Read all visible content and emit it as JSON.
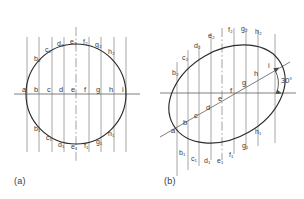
{
  "figure": {
    "colors": {
      "outline": "#2b2b2b",
      "ordinate": "#8a8a8a",
      "axis": "#6f6f6f",
      "centerline": "#8a8a8a",
      "text": "#3a3a3a",
      "background": "#ffffff"
    },
    "panels": [
      {
        "id": "a",
        "caption": "(a)",
        "shape": "circle",
        "description": "True-shape circle with nine equally spaced vertical ordinates",
        "center": {
          "x": 76,
          "y": 94
        },
        "radius": 50,
        "axis_labels": [
          "a",
          "b",
          "c",
          "d",
          "e",
          "f",
          "g",
          "h",
          "i"
        ],
        "upper_labels": [
          "b₂",
          "c₂",
          "d₂",
          "e₂",
          "f₂",
          "g₂",
          "h₂"
        ],
        "lower_labels": [
          "b₁",
          "c₁",
          "d₁",
          "e₁",
          "f₁",
          "g₁",
          "h₁"
        ],
        "ordinate_count": 9,
        "has_vertical_centerline": true,
        "has_horizontal_axis": true
      },
      {
        "id": "b",
        "caption": "(b)",
        "shape": "ellipse",
        "description": "Circle tilted 30 degrees producing an ellipse, same ordinates transferred",
        "center": {
          "x": 227,
          "y": 94
        },
        "semi_major": 62,
        "semi_minor": 44,
        "tilt_degrees": 30,
        "angle_label": "30°",
        "axis_labels": [
          "a",
          "b",
          "c",
          "d",
          "e",
          "f",
          "g",
          "h",
          "i"
        ],
        "upper_labels": [
          "b₂",
          "c₂",
          "d₂",
          "e₂",
          "f₂",
          "g₂",
          "h₂"
        ],
        "lower_labels": [
          "b₁",
          "c₁",
          "d₁",
          "e₁",
          "f₁",
          "g₁",
          "h₁"
        ],
        "ordinate_count": 9,
        "has_inclined_axis": true,
        "has_horizontal_reference": true,
        "has_centerline": true
      }
    ]
  }
}
